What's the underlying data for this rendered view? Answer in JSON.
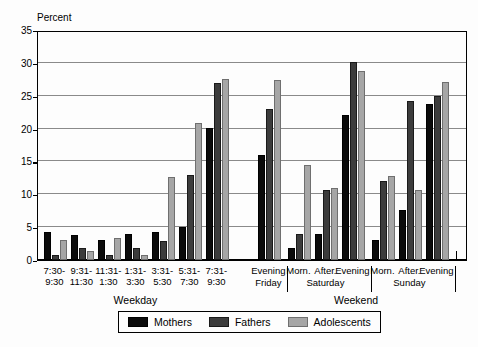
{
  "chart_data": {
    "type": "bar",
    "title": "",
    "subtitle": "",
    "xlabel": "",
    "ylabel": "Percent",
    "ylim": [
      0,
      35
    ],
    "yticks": [
      0,
      5,
      10,
      15,
      20,
      25,
      30,
      35
    ],
    "grid": true,
    "legend_position": "bottom",
    "categories": [
      "7:30-\n9:30",
      "9:31-\n11:30",
      "11:31-\n1:30",
      "1:31-\n3:30",
      "3:31-\n5:30",
      "5:31-\n7:30",
      "7:31-\n9:30",
      "Evening",
      "Morn.",
      "After.",
      "Evening",
      "Morn.",
      "After.",
      "Evening"
    ],
    "series": [
      {
        "name": "Mothers",
        "color": "#0b0b0b",
        "values": [
          4.3,
          3.8,
          3.0,
          4.0,
          4.3,
          5.0,
          20.1,
          16.0,
          1.9,
          4.0,
          22.0,
          3.0,
          7.6,
          23.8
        ]
      },
      {
        "name": "Fathers",
        "color": "#3c3c3c",
        "values": [
          0.8,
          1.9,
          0.8,
          1.8,
          2.9,
          13.0,
          27.0,
          23.0,
          4.0,
          10.6,
          30.1,
          12.1,
          24.2,
          25.0
        ]
      },
      {
        "name": "Adolescents",
        "color": "#a6a6a6",
        "values": [
          3.0,
          1.3,
          3.3,
          0.8,
          12.7,
          20.9,
          27.6,
          27.4,
          14.4,
          11.0,
          28.8,
          12.8,
          10.6,
          27.1
        ]
      }
    ],
    "groups": [
      {
        "label": "Weekday",
        "day": "",
        "categories": [
          0,
          1,
          2,
          3,
          4,
          5,
          6
        ]
      },
      {
        "label": "Weekend",
        "day": "Friday",
        "categories": [
          7
        ]
      },
      {
        "label": "Weekend",
        "day": "Saturday",
        "categories": [
          8,
          9,
          10
        ]
      },
      {
        "label": "Weekend",
        "day": "Sunday",
        "categories": [
          11,
          12,
          13
        ]
      }
    ],
    "day_labels": [
      "Friday",
      "Saturday",
      "Sunday"
    ],
    "section_labels": [
      "Weekday",
      "Weekend"
    ]
  },
  "legend": {
    "items": [
      {
        "label": "Mothers"
      },
      {
        "label": "Fathers"
      },
      {
        "label": "Adolescents"
      }
    ]
  },
  "axis": {
    "y_title": "Percent"
  }
}
